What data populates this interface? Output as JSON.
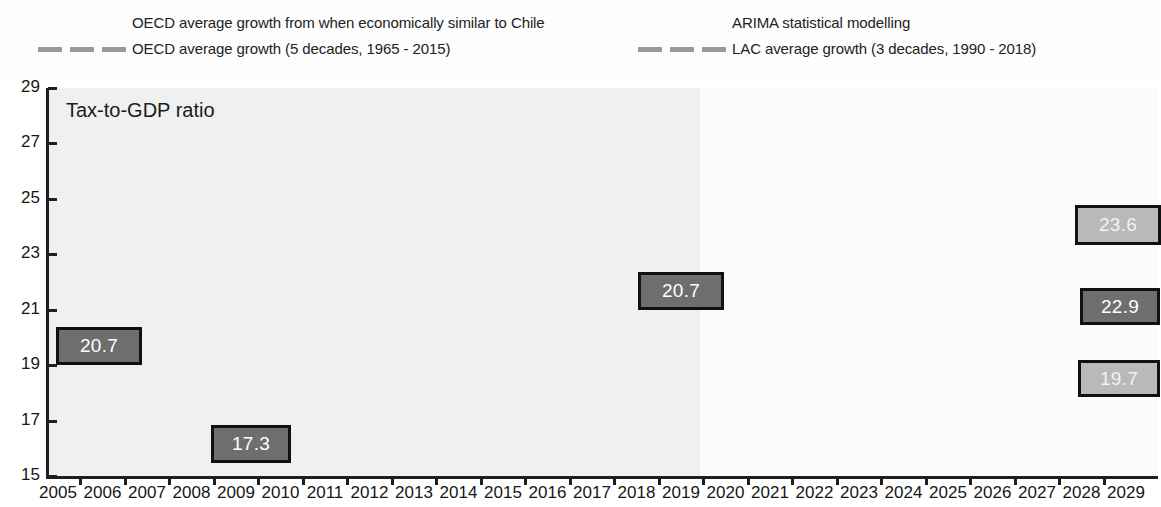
{
  "legend": {
    "items": [
      {
        "label": "OECD average growth from when economically similar to Chile",
        "key": "none",
        "col": "left",
        "row": 0
      },
      {
        "label": "OECD average growth (5 decades, 1965 - 2015)",
        "key": "dashed",
        "col": "left",
        "row": 1
      },
      {
        "label": "ARIMA statistical modelling",
        "key": "none",
        "col": "right",
        "row": 0
      },
      {
        "label": "LAC average growth (3 decades, 1990 - 2018)",
        "key": "dashed",
        "col": "right",
        "row": 1
      }
    ]
  },
  "chart_data": {
    "type": "line",
    "title": "Tax-to-GDP ratio",
    "xlabel": "",
    "ylabel": "",
    "ylim": [
      15,
      29
    ],
    "yticks": [
      15,
      17,
      19,
      21,
      23,
      25,
      27,
      29
    ],
    "grid": false,
    "legend_position": "top",
    "x": [
      2005,
      2006,
      2007,
      2008,
      2009,
      2010,
      2011,
      2012,
      2013,
      2014,
      2015,
      2016,
      2017,
      2018,
      2019,
      2020,
      2021,
      2022,
      2023,
      2024,
      2025,
      2026,
      2027,
      2028,
      2029
    ],
    "xticklabels": [
      "2005",
      "2006",
      "2007",
      "2008",
      "2009",
      "2010",
      "2011",
      "2012",
      "2013",
      "2014",
      "2015",
      "2016",
      "2017",
      "2018",
      "2019",
      "2020",
      "2021",
      "2022",
      "2023",
      "2024",
      "2025",
      "2026",
      "2027",
      "2028",
      "2029"
    ],
    "series": [
      {
        "name": "Chile tax-to-GDP ratio (historical)",
        "style": "solid",
        "color": "#9b9b9b",
        "x": [
          2005,
          2006,
          2007,
          2008,
          2009,
          2010,
          2011,
          2012,
          2013,
          2014,
          2015,
          2016,
          2017,
          2018,
          2019
        ],
        "values": [
          20.7,
          22.3,
          22.7,
          21.4,
          17.3,
          19.6,
          21.1,
          21.4,
          19.9,
          19.7,
          20.4,
          20.2,
          20.2,
          21.1,
          20.7
        ]
      },
      {
        "name": "OECD average growth (5 decades, 1965 - 2015)",
        "style": "dashed",
        "color": "#949494",
        "x": [
          2019,
          2020,
          2021,
          2022,
          2023,
          2024,
          2025,
          2026,
          2027,
          2028,
          2029
        ],
        "values": [
          20.7,
          20.9,
          21.2,
          21.5,
          21.8,
          22.1,
          22.4,
          22.6,
          22.8,
          23.0,
          23.1
        ]
      },
      {
        "name": "LAC average growth (3 decades, 1990 - 2018)",
        "style": "dashed",
        "color": "#9d9d9d",
        "x": [
          2019,
          2020,
          2021,
          2022,
          2023,
          2024,
          2025,
          2026,
          2027,
          2028,
          2029
        ],
        "values": [
          20.7,
          20.7,
          20.9,
          21.1,
          21.3,
          21.6,
          21.9,
          22.2,
          22.5,
          22.7,
          22.9
        ]
      },
      {
        "name": "ARIMA statistical modelling (confidence band)",
        "style": "band",
        "color": "#e6e6e6",
        "x": [
          2019,
          2020,
          2021,
          2022,
          2023,
          2024,
          2025,
          2026,
          2027,
          2028,
          2029
        ],
        "upper": [
          20.8,
          21.1,
          21.5,
          21.8,
          22.1,
          22.5,
          22.8,
          23.1,
          23.3,
          23.5,
          23.7
        ],
        "lower": [
          20.5,
          20.2,
          20.1,
          20.1,
          20.1,
          20.1,
          20.1,
          20.1,
          20.1,
          20.1,
          20.1
        ]
      }
    ],
    "annotations": [
      {
        "text": "20.7",
        "year": 2005,
        "value": 20.7,
        "style": "dark"
      },
      {
        "text": "17.3",
        "year": 2009,
        "value": 17.3,
        "style": "dark"
      },
      {
        "text": "20.7",
        "year": 2018,
        "value": 20.7,
        "style": "dark"
      },
      {
        "text": "23.6",
        "year": 2029,
        "value": 23.6,
        "style": "faint"
      },
      {
        "text": "22.9",
        "year": 2029,
        "value": 22.9,
        "style": "dark"
      },
      {
        "text": "19.7",
        "year": 2029,
        "value": 19.7,
        "style": "faint"
      }
    ]
  }
}
